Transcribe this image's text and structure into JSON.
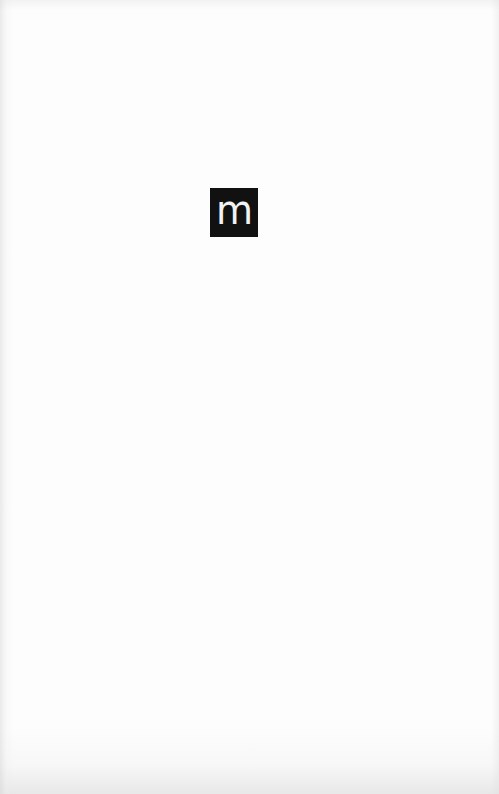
{
  "page": {
    "background_color": "#fdfdfd",
    "logo": {
      "icon": "publisher-logo-m",
      "glyph": "m",
      "background_color": "#111111",
      "glyph_color": "#f2f2f2"
    }
  }
}
